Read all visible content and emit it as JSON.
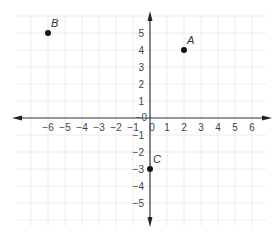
{
  "chart_data": {
    "type": "scatter",
    "title": "",
    "xlabel": "",
    "ylabel": "",
    "xlim": [
      -6,
      6
    ],
    "ylim": [
      -5,
      5
    ],
    "x_ticks": [
      -6,
      -5,
      -4,
      -3,
      -2,
      -1,
      0,
      1,
      2,
      3,
      4,
      5,
      6
    ],
    "y_ticks": [
      -5,
      -4,
      -3,
      -2,
      -1,
      0,
      1,
      2,
      3,
      4,
      5
    ],
    "x_tick_labels": [
      "−6",
      "−5",
      "−4",
      "−3",
      "−2",
      "−1",
      "0",
      "1",
      "2",
      "3",
      "4",
      "5",
      "6"
    ],
    "y_tick_labels": [
      "−5",
      "−4",
      "−3",
      "−2",
      "−1",
      "0",
      "1",
      "2",
      "3",
      "4",
      "5"
    ],
    "grid": true,
    "legend": "none",
    "points": [
      {
        "label": "B",
        "x": -6,
        "y": 5
      },
      {
        "label": "A",
        "x": 2,
        "y": 4
      },
      {
        "label": "C",
        "x": 0,
        "y": -3
      }
    ]
  }
}
